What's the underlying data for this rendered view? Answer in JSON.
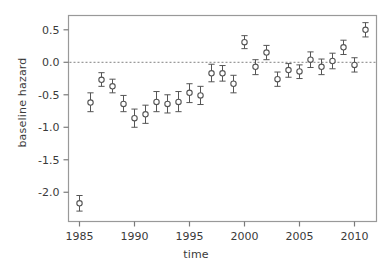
{
  "chart_data": {
    "type": "scatter",
    "title": "",
    "xlabel": "time",
    "ylabel": "baseline hazard",
    "xlim": [
      1984.0,
      1912.0
    ],
    "x_range": [
      1984.0,
      2012.0
    ],
    "ylim": [
      -2.45,
      0.72
    ],
    "grid": false,
    "legend": null,
    "zero_line": {
      "value": 0.0,
      "style": "dashed",
      "color": "#808080"
    },
    "xticks": [
      1985,
      1990,
      1995,
      2000,
      2005,
      2010
    ],
    "xtick_labels": [
      "1985",
      "1990",
      "1995",
      "2000",
      "2005",
      "2010"
    ],
    "yticks": [
      0.5,
      0.0,
      -0.5,
      -1.0,
      -1.5,
      -2.0
    ],
    "ytick_labels": [
      "0.5",
      "0.0",
      "-0.5",
      "-1.0",
      "-1.5",
      "-2.0"
    ],
    "marker": "open-circle",
    "errorbars": true,
    "x": [
      1985,
      1986,
      1987,
      1988,
      1989,
      1990,
      1991,
      1992,
      1993,
      1994,
      1995,
      1996,
      1997,
      1998,
      1999,
      2000,
      2001,
      2002,
      2003,
      2004,
      2005,
      2006,
      2007,
      2008,
      2009,
      2010,
      2011
    ],
    "values": [
      -2.17,
      -0.62,
      -0.27,
      -0.37,
      -0.64,
      -0.86,
      -0.8,
      -0.61,
      -0.64,
      -0.61,
      -0.47,
      -0.51,
      -0.17,
      -0.17,
      -0.33,
      0.31,
      -0.07,
      0.15,
      -0.26,
      -0.12,
      -0.14,
      0.04,
      -0.07,
      0.02,
      0.23,
      -0.04,
      0.5
    ],
    "ci_low": [
      -2.29,
      -0.76,
      -0.37,
      -0.47,
      -0.76,
      -1.0,
      -0.94,
      -0.76,
      -0.78,
      -0.76,
      -0.62,
      -0.65,
      -0.3,
      -0.29,
      -0.47,
      0.21,
      -0.19,
      0.04,
      -0.37,
      -0.23,
      -0.25,
      -0.08,
      -0.19,
      -0.1,
      0.12,
      -0.15,
      0.39
    ],
    "ci_high": [
      -2.05,
      -0.47,
      -0.16,
      -0.26,
      -0.51,
      -0.72,
      -0.66,
      -0.45,
      -0.5,
      -0.45,
      -0.33,
      -0.37,
      -0.03,
      -0.05,
      -0.2,
      0.41,
      0.04,
      0.26,
      -0.15,
      -0.02,
      -0.04,
      0.16,
      0.05,
      0.14,
      0.34,
      0.07,
      0.61
    ]
  },
  "axes": {
    "ylabel": "baseline hazard",
    "xlabel": "time"
  },
  "style": {
    "frame_color": "#999999",
    "tick_color": "#7a7a7a",
    "marker_color": "#555555",
    "text_color": "#3a3a3a"
  }
}
